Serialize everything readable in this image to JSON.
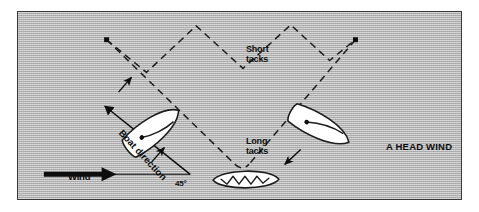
{
  "figure": {
    "background_color": "#b3b3b3",
    "border_color": "#3a3a3a",
    "ink_color": "#0d0d0d",
    "hull_fill": "#ffffff"
  },
  "labels": {
    "short_tacks": "Short\ntacks",
    "long_tacks": "Long\ntacks",
    "head_wind": "A HEAD WIND",
    "wind": "Wind",
    "angle": "45°",
    "boat_direction": "Boat direction"
  },
  "diagram": {
    "wind_arrow": {
      "name": "wind-arrow",
      "direction": "right",
      "from_x": 43,
      "to_x": 113,
      "y": 175
    },
    "wind_baseline": {
      "from_x": 113,
      "to_x": 190,
      "y": 175
    },
    "boat_direction_arrow": {
      "name": "boat-direction-arrow",
      "angle_deg": 45,
      "from_x": 190,
      "from_y": 175,
      "to_x": 100,
      "to_y": 103
    },
    "long_tack_left": {
      "from_x": 106,
      "from_y": 39,
      "to_x": 235,
      "to_y": 165
    },
    "long_tack_right": {
      "from_x": 356,
      "from_y": 39,
      "to_x": 249,
      "to_y": 165
    },
    "short_tacks_path": [
      [
        106,
        39
      ],
      [
        146,
        72
      ],
      [
        196,
        25
      ],
      [
        243,
        68
      ],
      [
        291,
        24
      ],
      [
        330,
        60
      ],
      [
        356,
        39
      ]
    ],
    "endpoint_dots": [
      {
        "name": "left-endpoint-dot",
        "x": 106,
        "y": 39
      },
      {
        "name": "right-endpoint-dot",
        "x": 356,
        "y": 39
      }
    ],
    "tack_arrows": [
      {
        "name": "tack-arrow-left-upper",
        "x": 126,
        "y": 83,
        "angle_deg": -55
      },
      {
        "name": "tack-arrow-left-lower",
        "x": 160,
        "y": 148,
        "angle_deg": -55
      },
      {
        "name": "tack-arrow-right",
        "x": 283,
        "y": 152,
        "angle_deg": 145
      }
    ],
    "boats": [
      {
        "name": "boat-left",
        "x": 152,
        "y": 130,
        "rotation_deg": -38
      },
      {
        "name": "boat-right",
        "x": 320,
        "y": 128,
        "rotation_deg": 28
      },
      {
        "name": "boat-bottom",
        "x": 248,
        "y": 181,
        "rotation_deg": 0
      }
    ]
  }
}
